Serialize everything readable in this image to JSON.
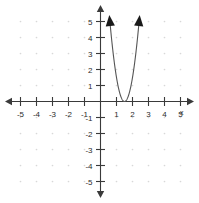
{
  "chart_data": {
    "type": "line",
    "title": "",
    "subtitle": "",
    "xlabel": "x",
    "ylabel": "",
    "xlim": [
      -5.8,
      5.8
    ],
    "ylim": [
      -5.8,
      5.8
    ],
    "grid": "dots at integer lattice points",
    "legend": "none",
    "x_ticks": [
      -5,
      -4,
      -3,
      -2,
      -1,
      1,
      2,
      3,
      4,
      5
    ],
    "y_ticks": [
      5,
      4,
      3,
      2,
      1,
      -1,
      -2,
      -3,
      -4,
      -5
    ],
    "x_tick_labels": [
      "-5",
      "-4",
      "-3",
      "-2",
      "-1",
      "1",
      "2",
      "3",
      "4",
      "5"
    ],
    "y_tick_labels": [
      "5",
      "4",
      "3",
      "2",
      "1",
      "-1",
      "-2",
      "-3",
      "-4",
      "-5"
    ],
    "axis_arrows": [
      "left",
      "right",
      "up",
      "down"
    ],
    "series": [
      {
        "name": "parabola",
        "type": "parabola",
        "vertex": [
          1.5,
          0
        ],
        "opens": "up",
        "leading_coefficient": 6.0,
        "equation": "y = 6(x - 1.5)^2",
        "arrow_ends": [
          "left-branch-top",
          "right-branch-top"
        ],
        "points": [
          [
            0.59,
            5.0
          ],
          [
            0.7,
            3.84
          ],
          [
            0.9,
            2.16
          ],
          [
            1.1,
            0.96
          ],
          [
            1.3,
            0.24
          ],
          [
            1.5,
            0.0
          ],
          [
            1.7,
            0.24
          ],
          [
            1.9,
            0.96
          ],
          [
            2.1,
            2.16
          ],
          [
            2.3,
            3.84
          ],
          [
            2.41,
            5.0
          ]
        ]
      }
    ]
  },
  "axis": {
    "x_name": "x"
  }
}
